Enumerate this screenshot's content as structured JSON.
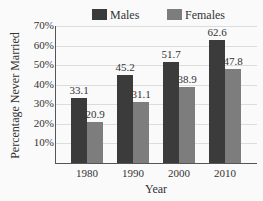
{
  "chart_data": {
    "type": "bar",
    "title": "",
    "xlabel": "Year",
    "ylabel": "Percentage Never Married",
    "categories": [
      "1980",
      "1990",
      "2000",
      "2010"
    ],
    "series": [
      {
        "name": "Males",
        "values": [
          33.1,
          45.2,
          51.7,
          62.6
        ],
        "color": "#3b3b3b"
      },
      {
        "name": "Females",
        "values": [
          20.9,
          31.1,
          38.9,
          47.8
        ],
        "color": "#7d7d7d"
      }
    ],
    "value_labels": {
      "Males": [
        "33.1",
        "45.2",
        "51.7",
        "62.6"
      ],
      "Females": [
        "20.9",
        "31.1",
        "38.9",
        "47.8"
      ]
    },
    "yticks": [
      "10%",
      "20%",
      "30%",
      "40%",
      "50%",
      "60%",
      "70%"
    ],
    "ylim": [
      0,
      70
    ],
    "grid": true,
    "legend_position": "top"
  }
}
